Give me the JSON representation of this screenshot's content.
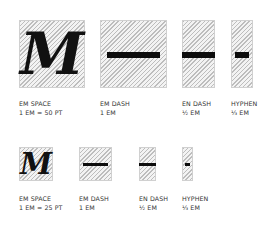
{
  "rows": [
    {
      "scale": "1 EM = 50 PT",
      "items": [
        {
          "name": "EM SPACE",
          "size": "1 EM = 50 PT",
          "glyph": "M"
        },
        {
          "name": "EM DASH",
          "size": "1 EM",
          "glyph": "—"
        },
        {
          "name": "EN DASH",
          "size": "½ EM",
          "glyph": "–"
        },
        {
          "name": "HYPHEN",
          "size": "⅓ EM",
          "glyph": "-"
        }
      ]
    },
    {
      "scale": "1 EM = 25 PT",
      "items": [
        {
          "name": "EM SPACE",
          "size": "1 EM = 25 PT",
          "glyph": "M"
        },
        {
          "name": "EM DASH",
          "size": "1 EM",
          "glyph": "—"
        },
        {
          "name": "EN DASH",
          "size": "½ EM",
          "glyph": "–"
        },
        {
          "name": "HYPHEN",
          "size": "⅓ EM",
          "glyph": "-"
        }
      ]
    }
  ],
  "colors": {
    "hatch": "#bdbdbd",
    "box_bg": "#f3f3f3",
    "ink": "#0c0c0c",
    "label": "#333333"
  }
}
